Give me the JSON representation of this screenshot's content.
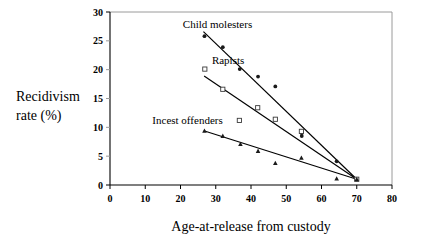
{
  "chart_data": {
    "type": "scatter",
    "title": "",
    "xlabel": "Age-at-release from custody",
    "ylabel": "Recidivism rate (%)",
    "ylabel_line1": "Recidivism",
    "ylabel_line2": "rate (%)",
    "xlim": [
      0,
      80
    ],
    "ylim": [
      0,
      30
    ],
    "xticks": [
      0,
      10,
      20,
      30,
      40,
      50,
      60,
      70,
      80
    ],
    "yticks": [
      0,
      5,
      10,
      15,
      20,
      25,
      30
    ],
    "xtick_labels": [
      "0",
      "10",
      "20",
      "30",
      "40",
      "50",
      "60",
      "70",
      "80"
    ],
    "ytick_labels": [
      "0",
      "5",
      "10",
      "15",
      "20",
      "25",
      "30"
    ],
    "grid": false,
    "legend_position": "inline-annotations",
    "series": [
      {
        "name": "Child molesters",
        "marker": "filled-circle",
        "label_x": 30.5,
        "label_y": 27.2,
        "points": [
          {
            "x": 26.8,
            "y": 25.8
          },
          {
            "x": 32.0,
            "y": 23.9
          },
          {
            "x": 36.8,
            "y": 20.1
          },
          {
            "x": 42.0,
            "y": 18.8
          },
          {
            "x": 46.9,
            "y": 17.1
          },
          {
            "x": 54.4,
            "y": 9.0
          },
          {
            "x": 54.4,
            "y": 8.5
          },
          {
            "x": 64.3,
            "y": 4.1
          },
          {
            "x": 70.0,
            "y": 1.0
          }
        ],
        "fit": {
          "x1": 26.5,
          "y1": 26.6,
          "x2": 70.0,
          "y2": 1.0
        }
      },
      {
        "name": "Rapists",
        "marker": "open-square",
        "label_x": 33.5,
        "label_y": 20.9,
        "points": [
          {
            "x": 26.9,
            "y": 20.1
          },
          {
            "x": 32.0,
            "y": 16.6
          },
          {
            "x": 36.7,
            "y": 11.2
          },
          {
            "x": 41.9,
            "y": 13.4
          },
          {
            "x": 46.9,
            "y": 11.4
          },
          {
            "x": 54.3,
            "y": 9.3
          },
          {
            "x": 70.0,
            "y": 1.0
          }
        ],
        "fit": {
          "x1": 26.7,
          "y1": 18.9,
          "x2": 70.0,
          "y2": 1.0
        }
      },
      {
        "name": "Incest offenders",
        "marker": "filled-triangle",
        "label_x": 22.0,
        "label_y": 10.6,
        "points": [
          {
            "x": 26.8,
            "y": 9.4
          },
          {
            "x": 32.0,
            "y": 8.5
          },
          {
            "x": 37.0,
            "y": 7.1
          },
          {
            "x": 42.0,
            "y": 5.9
          },
          {
            "x": 46.9,
            "y": 3.8
          },
          {
            "x": 54.3,
            "y": 4.7
          },
          {
            "x": 64.3,
            "y": 1.1
          },
          {
            "x": 70.0,
            "y": 1.0
          }
        ],
        "fit": {
          "x1": 26.6,
          "y1": 9.4,
          "x2": 70.0,
          "y2": 1.0
        }
      }
    ]
  }
}
